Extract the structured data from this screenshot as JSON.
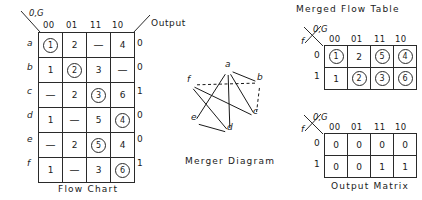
{
  "flow_chart": {
    "caption": "Flow  Chart",
    "corner_label": "0,G",
    "output_header": "Output",
    "columns": [
      "00",
      "01",
      "11",
      "10"
    ],
    "rows": [
      {
        "label": "a",
        "cells": [
          {
            "v": "1",
            "circled": true
          },
          {
            "v": "2",
            "circled": false
          },
          {
            "v": "—",
            "circled": false
          },
          {
            "v": "4",
            "circled": false
          }
        ],
        "output": "0"
      },
      {
        "label": "b",
        "cells": [
          {
            "v": "1",
            "circled": false
          },
          {
            "v": "2",
            "circled": true
          },
          {
            "v": "3",
            "circled": false
          },
          {
            "v": "—",
            "circled": false
          }
        ],
        "output": "0"
      },
      {
        "label": "c",
        "cells": [
          {
            "v": "—",
            "circled": false
          },
          {
            "v": "2",
            "circled": false
          },
          {
            "v": "3",
            "circled": true
          },
          {
            "v": "6",
            "circled": false
          }
        ],
        "output": "1"
      },
      {
        "label": "d",
        "cells": [
          {
            "v": "1",
            "circled": false
          },
          {
            "v": "—",
            "circled": false
          },
          {
            "v": "5",
            "circled": false
          },
          {
            "v": "4",
            "circled": true
          }
        ],
        "output": "0"
      },
      {
        "label": "e",
        "cells": [
          {
            "v": "—",
            "circled": false
          },
          {
            "v": "2",
            "circled": false
          },
          {
            "v": "5",
            "circled": true
          },
          {
            "v": "4",
            "circled": false
          }
        ],
        "output": "0"
      },
      {
        "label": "f",
        "cells": [
          {
            "v": "1",
            "circled": false
          },
          {
            "v": "—",
            "circled": false
          },
          {
            "v": "3",
            "circled": false
          },
          {
            "v": "6",
            "circled": true
          }
        ],
        "output": "1"
      }
    ]
  },
  "merger_diagram": {
    "caption": "Merger  Diagram",
    "nodes": [
      {
        "id": "a",
        "label": "a",
        "x": 228,
        "y": 70
      },
      {
        "id": "b",
        "label": "b",
        "x": 260,
        "y": 83
      },
      {
        "id": "c",
        "label": "c",
        "x": 256,
        "y": 117
      },
      {
        "id": "d",
        "label": "d",
        "x": 230,
        "y": 133
      },
      {
        "id": "e",
        "label": "e",
        "x": 194,
        "y": 123
      },
      {
        "id": "f",
        "label": "f",
        "x": 190,
        "y": 85
      }
    ],
    "edges": [
      {
        "from": "a",
        "to": "b",
        "style": "solid"
      },
      {
        "from": "a",
        "to": "c",
        "style": "solid"
      },
      {
        "from": "a",
        "to": "d",
        "style": "solid"
      },
      {
        "from": "a",
        "to": "e",
        "style": "solid"
      },
      {
        "from": "b",
        "to": "c",
        "style": "dashed"
      },
      {
        "from": "b",
        "to": "f",
        "style": "dashed"
      },
      {
        "from": "c",
        "to": "f",
        "style": "solid"
      },
      {
        "from": "d",
        "to": "e",
        "style": "solid"
      },
      {
        "from": "d",
        "to": "f",
        "style": "solid"
      }
    ]
  },
  "merged_flow_table": {
    "title": "Merged  Flow  Table",
    "corner_label": "0,G",
    "corner_row_label": "f",
    "columns": [
      "00",
      "01",
      "11",
      "10"
    ],
    "rows": [
      {
        "label": "0",
        "cells": [
          {
            "v": "1",
            "circled": true
          },
          {
            "v": "2",
            "circled": false
          },
          {
            "v": "5",
            "circled": true
          },
          {
            "v": "4",
            "circled": true
          }
        ]
      },
      {
        "label": "1",
        "cells": [
          {
            "v": "1",
            "circled": false
          },
          {
            "v": "2",
            "circled": true
          },
          {
            "v": "3",
            "circled": true
          },
          {
            "v": "6",
            "circled": true
          }
        ]
      }
    ]
  },
  "output_matrix": {
    "caption": "Output   Matrix",
    "corner_label": "0,G",
    "corner_row_label": "f",
    "columns": [
      "00",
      "01",
      "11",
      "10"
    ],
    "rows": [
      {
        "label": "0",
        "cells": [
          {
            "v": "0",
            "circled": false
          },
          {
            "v": "0",
            "circled": false
          },
          {
            "v": "0",
            "circled": false
          },
          {
            "v": "0",
            "circled": false
          }
        ]
      },
      {
        "label": "1",
        "cells": [
          {
            "v": "0",
            "circled": false
          },
          {
            "v": "0",
            "circled": false
          },
          {
            "v": "1",
            "circled": false
          },
          {
            "v": "1",
            "circled": false
          }
        ]
      }
    ]
  },
  "colors": {
    "ink": "#1a1a1a",
    "rule": "#2a2a2a",
    "background": "#ffffff"
  }
}
